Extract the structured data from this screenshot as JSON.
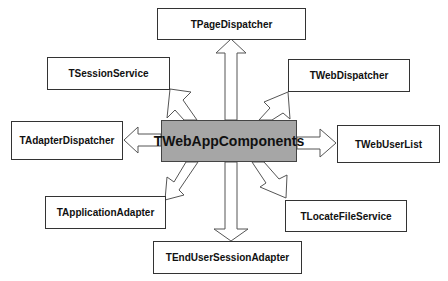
{
  "diagram": {
    "center": {
      "label": "TWebAppComponents",
      "fill": "#a6a6a6"
    },
    "nodes": [
      {
        "id": "page-dispatcher",
        "label": "TPageDispatcher"
      },
      {
        "id": "session-service",
        "label": "TSessionService"
      },
      {
        "id": "web-dispatcher",
        "label": "TWebDispatcher"
      },
      {
        "id": "adapter-dispatcher",
        "label": "TAdapterDispatcher"
      },
      {
        "id": "web-user-list",
        "label": "TWebUserList"
      },
      {
        "id": "application-adapter",
        "label": "TApplicationAdapter"
      },
      {
        "id": "locate-file-service",
        "label": "TLocateFileService"
      },
      {
        "id": "end-user-session-adapter",
        "label": "TEndUserSessionAdapter"
      }
    ],
    "edges": [
      {
        "from": "TWebAppComponents",
        "to": "TPageDispatcher",
        "style": "hollow-block-arrow"
      },
      {
        "from": "TWebAppComponents",
        "to": "TSessionService",
        "style": "hollow-block-arrow"
      },
      {
        "from": "TWebAppComponents",
        "to": "TWebDispatcher",
        "style": "hollow-block-arrow"
      },
      {
        "from": "TWebAppComponents",
        "to": "TAdapterDispatcher",
        "style": "hollow-block-arrow"
      },
      {
        "from": "TWebAppComponents",
        "to": "TWebUserList",
        "style": "hollow-block-arrow"
      },
      {
        "from": "TWebAppComponents",
        "to": "TApplicationAdapter",
        "style": "hollow-block-arrow"
      },
      {
        "from": "TWebAppComponents",
        "to": "TLocateFileService",
        "style": "hollow-block-arrow"
      },
      {
        "from": "TWebAppComponents",
        "to": "TEndUserSessionAdapter",
        "style": "hollow-block-arrow"
      }
    ]
  }
}
